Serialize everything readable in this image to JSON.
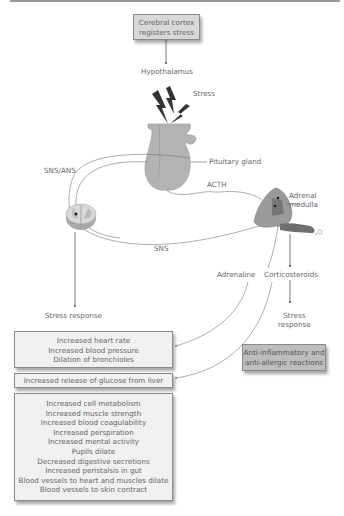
{
  "title_box": {
    "lines": [
      "Cerebral cortex",
      "registers stress"
    ]
  },
  "labels": {
    "hypothalamus": "Hypothalamus",
    "stress": "Stress",
    "pituitary": "Pituitary gland",
    "sns_ans": "SNS/ANS",
    "acth": "ACTH",
    "adrenal_medulla": [
      "Adrenal",
      "medulla"
    ],
    "sns": "SNS",
    "adrenaline": "Adrenaline",
    "corticosteroids": "Corticosteroids",
    "stress_response_left": "Stress response",
    "stress_response_right": [
      "Stress",
      "response"
    ]
  },
  "boxes": {
    "cardio": [
      "Increased heart rate",
      "Increased blood pressure",
      "Dilation of bronchioles"
    ],
    "glucose": [
      "Increased release of glucose from liver"
    ],
    "anti": [
      "Anti-inflammatory and",
      "anti-allergic reactions"
    ],
    "effects": [
      "Increased cell metabolism",
      "Increased muscle strength",
      "Increased blood coagulability",
      "Increased perspiration",
      "Increased mental activity",
      "Pupils dilate",
      "Decreased digestive secretions",
      "Increased peristalsis in gut",
      "Blood vessels to heart and muscles dilate",
      "Blood vessels to skin contract"
    ]
  },
  "colors": {
    "line": "#6a6a6a",
    "gland": "#b0b0b0",
    "adrenal": "#8c8c8c",
    "box_light": "#f0f0f0",
    "box_dark": "#bdbdbd"
  }
}
